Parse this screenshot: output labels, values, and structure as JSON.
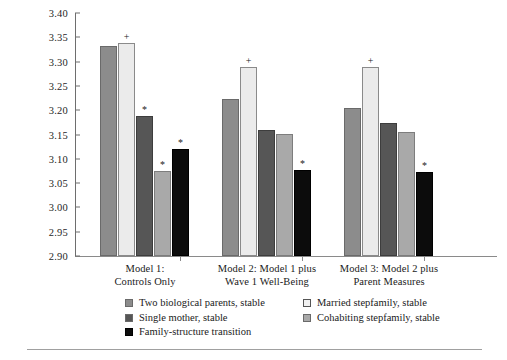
{
  "chart_data": {
    "type": "bar",
    "title": "",
    "xlabel": "",
    "ylabel": "Predicted Probability",
    "ylim": [
      2.9,
      3.4
    ],
    "ytick_step": 0.05,
    "yticks": [
      "3.40",
      "3.35",
      "3.30",
      "3.25",
      "3.20",
      "3.15",
      "3.10",
      "3.05",
      "3.00",
      "2.95",
      "2.90"
    ],
    "grid": false,
    "legend_position": "below-axes",
    "categories": [
      "Model 1: Controls Only",
      "Model 2: Model 1 plus Wave 1 Well-Being",
      "Model 3: Model 2 plus Parent Measures"
    ],
    "series": [
      {
        "name": "Two biological parents, stable",
        "color": "#8c8c8c",
        "values": [
          3.332,
          3.224,
          3.205
        ],
        "annotations": [
          "",
          "",
          ""
        ]
      },
      {
        "name": "Married stepfamily, stable",
        "color": "#ebebeb",
        "values": [
          3.338,
          3.289,
          3.288
        ],
        "annotations": [
          "+",
          "+",
          "+"
        ]
      },
      {
        "name": "Single mother, stable",
        "color": "#565656",
        "values": [
          3.189,
          3.16,
          3.173
        ],
        "annotations": [
          "*",
          "",
          ""
        ]
      },
      {
        "name": "Cohabiting stepfamily, stable",
        "color": "#a9a9a9",
        "values": [
          3.074,
          3.152,
          3.155
        ],
        "annotations": [
          "*",
          "",
          ""
        ]
      },
      {
        "name": "Family-structure transition",
        "color": "#0c0c0c",
        "values": [
          3.12,
          3.076,
          3.073
        ],
        "annotations": [
          "*",
          "*",
          "*"
        ]
      }
    ]
  },
  "axis": {
    "y_title": "Predicted Probability",
    "y_ticks": [
      "3.40",
      "3.35",
      "3.30",
      "3.25",
      "3.20",
      "3.15",
      "3.10",
      "3.05",
      "3.00",
      "2.95",
      "2.90"
    ]
  },
  "groups": [
    {
      "line1": "Model 1:",
      "line2": "Controls Only"
    },
    {
      "line1": "Model 2: Model 1 plus",
      "line2": "Wave 1 Well-Being"
    },
    {
      "line1": "Model 3: Model 2 plus",
      "line2": "Parent Measures"
    }
  ],
  "legend": {
    "left": [
      "Two biological parents, stable",
      "Single mother, stable",
      "Family-structure transition"
    ],
    "right": [
      "Married stepfamily, stable",
      "Cohabiting stepfamily, stable"
    ]
  }
}
